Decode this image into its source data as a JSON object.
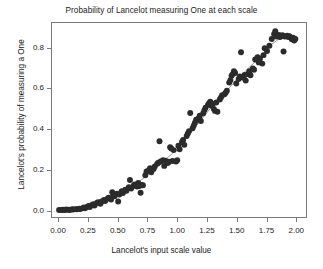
{
  "chart_data": {
    "type": "scatter",
    "title": "Probability of Lancelot measuring One at each scale",
    "xlabel": "Lancelot's input scale value",
    "ylabel": "Lancelot's probability of measuring a One",
    "xlim": [
      -0.06,
      2.09
    ],
    "ylim": [
      -0.035,
      0.925
    ],
    "xticks": [
      0.0,
      0.25,
      0.5,
      0.75,
      1.0,
      1.25,
      1.5,
      1.75,
      2.0
    ],
    "xticklabels": [
      "0.00",
      "0.25",
      "0.50",
      "0.75",
      "1.00",
      "1.25",
      "1.50",
      "1.75",
      "2.00"
    ],
    "yticks": [
      0.0,
      0.2,
      0.4,
      0.6,
      0.8
    ],
    "yticklabels": [
      "0.0",
      "0.2",
      "0.4",
      "0.6",
      "0.8"
    ],
    "grid": false,
    "legend": false,
    "point_color": "#2b2b2b",
    "point_size": 3.0,
    "line_color": "#8c8c8c",
    "line_width": 0.9,
    "frame_color": "#7a7a7a",
    "background": "#ffffff",
    "series": [
      {
        "name": "observed probability",
        "type": "scatter",
        "points": [
          [
            0.0,
            0.0
          ],
          [
            0.02,
            0.0
          ],
          [
            0.03,
            0.001
          ],
          [
            0.05,
            0.0
          ],
          [
            0.06,
            0.002
          ],
          [
            0.08,
            0.001
          ],
          [
            0.09,
            0.0
          ],
          [
            0.11,
            0.003
          ],
          [
            0.12,
            0.002
          ],
          [
            0.14,
            0.004
          ],
          [
            0.15,
            0.003
          ],
          [
            0.17,
            0.006
          ],
          [
            0.18,
            0.005
          ],
          [
            0.2,
            0.009
          ],
          [
            0.21,
            0.012
          ],
          [
            0.22,
            0.008
          ],
          [
            0.24,
            0.016
          ],
          [
            0.25,
            0.02
          ],
          [
            0.26,
            0.014
          ],
          [
            0.28,
            0.024
          ],
          [
            0.29,
            0.028
          ],
          [
            0.3,
            0.022
          ],
          [
            0.32,
            0.034
          ],
          [
            0.33,
            0.038
          ],
          [
            0.35,
            0.031
          ],
          [
            0.36,
            0.042
          ],
          [
            0.38,
            0.049
          ],
          [
            0.39,
            0.044
          ],
          [
            0.41,
            0.056
          ],
          [
            0.42,
            0.06
          ],
          [
            0.44,
            0.052
          ],
          [
            0.45,
            0.088
          ],
          [
            0.46,
            0.072
          ],
          [
            0.47,
            0.068
          ],
          [
            0.49,
            0.08
          ],
          [
            0.5,
            0.042
          ],
          [
            0.51,
            0.076
          ],
          [
            0.53,
            0.092
          ],
          [
            0.54,
            0.084
          ],
          [
            0.56,
            0.1
          ],
          [
            0.57,
            0.095
          ],
          [
            0.59,
            0.112
          ],
          [
            0.6,
            0.148
          ],
          [
            0.61,
            0.106
          ],
          [
            0.63,
            0.12
          ],
          [
            0.64,
            0.126
          ],
          [
            0.66,
            0.116
          ],
          [
            0.67,
            0.133
          ],
          [
            0.68,
            0.118
          ],
          [
            0.69,
            0.085
          ],
          [
            0.7,
            0.124
          ],
          [
            0.71,
            0.122
          ],
          [
            0.73,
            0.172
          ],
          [
            0.74,
            0.19
          ],
          [
            0.76,
            0.196
          ],
          [
            0.77,
            0.206
          ],
          [
            0.78,
            0.186
          ],
          [
            0.8,
            0.202
          ],
          [
            0.81,
            0.215
          ],
          [
            0.83,
            0.228
          ],
          [
            0.84,
            0.234
          ],
          [
            0.85,
            0.34
          ],
          [
            0.86,
            0.24
          ],
          [
            0.88,
            0.246
          ],
          [
            0.89,
            0.218
          ],
          [
            0.9,
            0.244
          ],
          [
            0.92,
            0.232
          ],
          [
            0.93,
            0.238
          ],
          [
            0.94,
            0.31
          ],
          [
            0.95,
            0.304
          ],
          [
            0.96,
            0.242
          ],
          [
            0.97,
            0.296
          ],
          [
            0.99,
            0.24
          ],
          [
            1.0,
            0.246
          ],
          [
            1.01,
            0.318
          ],
          [
            1.02,
            0.3
          ],
          [
            1.04,
            0.336
          ],
          [
            1.05,
            0.346
          ],
          [
            1.06,
            0.322
          ],
          [
            1.08,
            0.366
          ],
          [
            1.09,
            0.378
          ],
          [
            1.1,
            0.39
          ],
          [
            1.11,
            0.48
          ],
          [
            1.13,
            0.404
          ],
          [
            1.14,
            0.418
          ],
          [
            1.15,
            0.432
          ],
          [
            1.16,
            0.446
          ],
          [
            1.18,
            0.452
          ],
          [
            1.19,
            0.466
          ],
          [
            1.2,
            0.44
          ],
          [
            1.22,
            0.478
          ],
          [
            1.23,
            0.494
          ],
          [
            1.24,
            0.506
          ],
          [
            1.26,
            0.52
          ],
          [
            1.27,
            0.528
          ],
          [
            1.28,
            0.536
          ],
          [
            1.29,
            0.516
          ],
          [
            1.3,
            0.524
          ],
          [
            1.31,
            0.5
          ],
          [
            1.32,
            0.49
          ],
          [
            1.33,
            0.532
          ],
          [
            1.34,
            0.486
          ],
          [
            1.36,
            0.546
          ],
          [
            1.37,
            0.556
          ],
          [
            1.38,
            0.568
          ],
          [
            1.4,
            0.572
          ],
          [
            1.41,
            0.58
          ],
          [
            1.42,
            0.59
          ],
          [
            1.44,
            0.63
          ],
          [
            1.45,
            0.642
          ],
          [
            1.46,
            0.664
          ],
          [
            1.47,
            0.672
          ],
          [
            1.48,
            0.686
          ],
          [
            1.49,
            0.678
          ],
          [
            1.5,
            0.626
          ],
          [
            1.52,
            0.648
          ],
          [
            1.53,
            0.66
          ],
          [
            1.54,
            0.78
          ],
          [
            1.56,
            0.654
          ],
          [
            1.57,
            0.668
          ],
          [
            1.58,
            0.64
          ],
          [
            1.6,
            0.672
          ],
          [
            1.61,
            0.686
          ],
          [
            1.62,
            0.666
          ],
          [
            1.64,
            0.7
          ],
          [
            1.65,
            0.694
          ],
          [
            1.66,
            0.744
          ],
          [
            1.68,
            0.756
          ],
          [
            1.69,
            0.73
          ],
          [
            1.7,
            0.748
          ],
          [
            1.72,
            0.724
          ],
          [
            1.73,
            0.766
          ],
          [
            1.74,
            0.8
          ],
          [
            1.76,
            0.786
          ],
          [
            1.78,
            0.812
          ],
          [
            1.8,
            0.846
          ],
          [
            1.82,
            0.87
          ],
          [
            1.83,
            0.884
          ],
          [
            1.84,
            0.858
          ],
          [
            1.85,
            0.862
          ],
          [
            1.86,
            0.866
          ],
          [
            1.87,
            0.856
          ],
          [
            1.88,
            0.86
          ],
          [
            1.89,
            0.864
          ],
          [
            1.9,
            0.784
          ],
          [
            1.91,
            0.858
          ],
          [
            1.93,
            0.862
          ],
          [
            1.94,
            0.856
          ],
          [
            1.95,
            0.86
          ],
          [
            1.96,
            0.854
          ],
          [
            1.97,
            0.844
          ],
          [
            1.98,
            0.852
          ],
          [
            1.99,
            0.838
          ],
          [
            2.0,
            0.846
          ]
        ]
      },
      {
        "name": "fitted curve",
        "type": "line",
        "points": [
          [
            0.0,
            0.0
          ],
          [
            0.1,
            0.002
          ],
          [
            0.2,
            0.008
          ],
          [
            0.3,
            0.022
          ],
          [
            0.4,
            0.046
          ],
          [
            0.5,
            0.076
          ],
          [
            0.6,
            0.11
          ],
          [
            0.7,
            0.15
          ],
          [
            0.8,
            0.198
          ],
          [
            0.9,
            0.25
          ],
          [
            1.0,
            0.3
          ],
          [
            1.1,
            0.37
          ],
          [
            1.2,
            0.444
          ],
          [
            1.3,
            0.516
          ],
          [
            1.4,
            0.578
          ],
          [
            1.5,
            0.642
          ],
          [
            1.6,
            0.7
          ],
          [
            1.7,
            0.756
          ],
          [
            1.8,
            0.82
          ],
          [
            1.9,
            0.862
          ],
          [
            2.0,
            0.86
          ]
        ]
      }
    ]
  }
}
